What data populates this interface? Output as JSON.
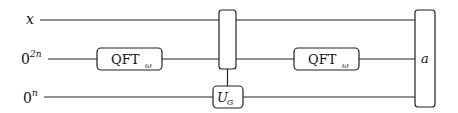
{
  "diagram": {
    "type": "quantum-circuit",
    "wires": [
      {
        "id": "w0",
        "label": "x",
        "label_sup": ""
      },
      {
        "id": "w1",
        "label": "0",
        "label_sup": "2n"
      },
      {
        "id": "w2",
        "label": "0",
        "label_sup": "n"
      }
    ],
    "gates": [
      {
        "id": "qft1",
        "label": "QFT",
        "sub": "ω",
        "wires": [
          "w1"
        ]
      },
      {
        "id": "controller",
        "label": "",
        "wires": [
          "w0",
          "w1"
        ]
      },
      {
        "id": "ug",
        "label": "U",
        "sub": "G",
        "wires": [
          "w2"
        ]
      },
      {
        "id": "qft2",
        "label": "QFT",
        "sub": "ω",
        "wires": [
          "w1"
        ]
      },
      {
        "id": "measure",
        "label": "a",
        "wires": [
          "w0",
          "w1",
          "w2"
        ]
      }
    ],
    "colors": {
      "line": "#222222",
      "background": "#ffffff"
    }
  }
}
